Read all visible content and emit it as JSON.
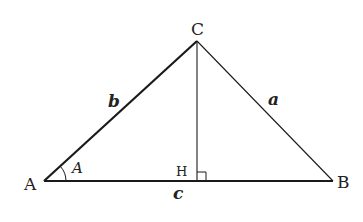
{
  "diagram": {
    "type": "triangle-with-altitude",
    "colors": {
      "stroke": "#1a1a1a",
      "text": "#222222",
      "background": "#ffffff"
    },
    "vertices": {
      "A": {
        "label": "A",
        "x": 44,
        "y": 181
      },
      "B": {
        "label": "B",
        "x": 333,
        "y": 181
      },
      "C": {
        "label": "C",
        "x": 197,
        "y": 41
      },
      "H": {
        "label": "H",
        "x": 197,
        "y": 181
      }
    },
    "sides": {
      "a": {
        "label": "a",
        "from": "B",
        "to": "C"
      },
      "b": {
        "label": "b",
        "from": "A",
        "to": "C",
        "emphasized": true
      },
      "c": {
        "label": "c",
        "from": "A",
        "to": "B",
        "emphasized": true
      }
    },
    "altitude": {
      "from": "C",
      "to": "H",
      "right_angle_mark": true
    },
    "angle": {
      "label": "A",
      "vertex": "A",
      "arc": true
    }
  }
}
